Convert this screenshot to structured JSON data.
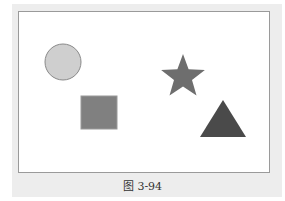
{
  "figure": {
    "caption": "图 3-94",
    "background_color": "#ededed",
    "frame_color": "#ffffff",
    "frame_border_color": "#9a9a9a"
  },
  "shapes": [
    {
      "type": "circle",
      "cx": 63,
      "cy": 62,
      "r": 18,
      "fill": "#cfcfcf",
      "stroke": "#8a8a8a"
    },
    {
      "type": "square",
      "x": 81,
      "y": 96,
      "width": 36,
      "height": 33,
      "fill": "#808080",
      "stroke": "#9a9a9a"
    },
    {
      "type": "star",
      "cx": 183,
      "cy": 77,
      "outer_r": 23,
      "inner_r": 9.5,
      "fill": "#6e6e6e"
    },
    {
      "type": "triangle",
      "points": "223,100 246,137 200,137",
      "fill": "#4a4a4a"
    }
  ]
}
